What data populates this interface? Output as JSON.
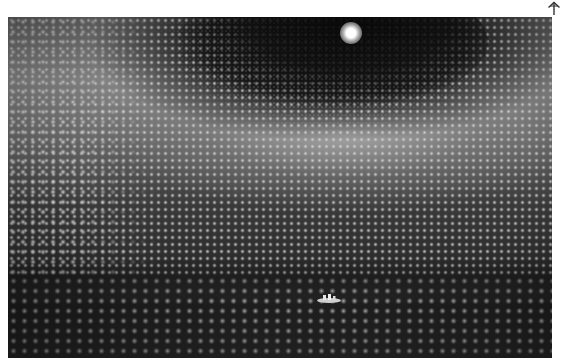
{
  "page": {
    "background": "#ffffff"
  },
  "corner_glyph": {
    "icon": "up-arrow-icon",
    "color": "#333333"
  },
  "photo": {
    "subject": "interior of large cylindrical detector tank lined with grid of spherical photomultiplier sensors",
    "color_mode": "grayscale",
    "elements": {
      "ceiling_light": "bright light at top center of dark dome",
      "boat": "small inflatable boat with people near bottom center"
    },
    "palette": {
      "dark": "#1a1a1a",
      "mid": "#6e6e6e",
      "highlight": "#e8e8e8"
    }
  }
}
